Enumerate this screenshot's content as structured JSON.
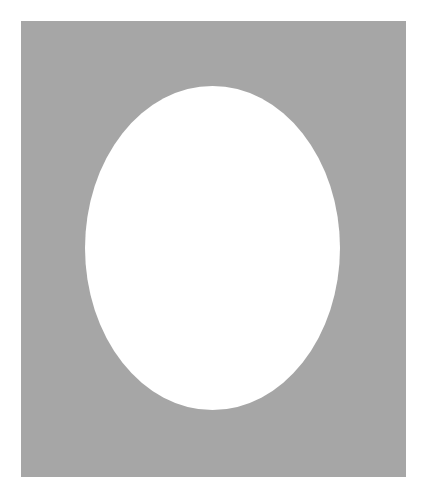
{
  "scene": {
    "canvas": {
      "width": 427,
      "height": 499,
      "background": "#ffffff"
    },
    "mat": {
      "shape": "rectangle",
      "x": 21,
      "y": 21,
      "width": 385,
      "height": 456,
      "fill": "#a6a6a6"
    },
    "oval_window": {
      "shape": "ellipse",
      "x": 85,
      "y": 86,
      "width": 255,
      "height": 324,
      "fill": "#ffffff"
    }
  }
}
